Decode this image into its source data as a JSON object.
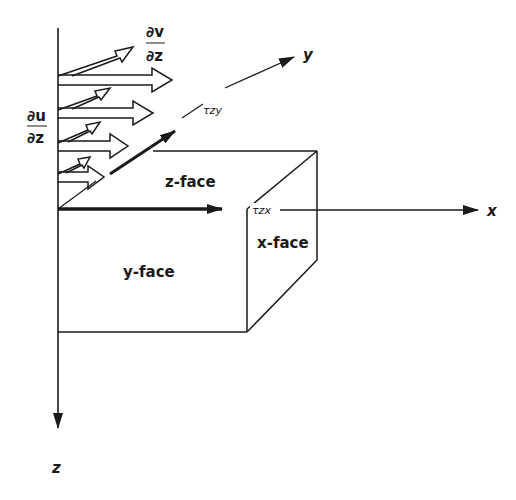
{
  "diagram": {
    "axes": {
      "x_label": "x",
      "y_label": "y",
      "z_label": "z"
    },
    "faces": {
      "z_face": "z-face",
      "y_face": "y-face",
      "x_face": "x-face"
    },
    "stresses": {
      "tau_zy": "τzy",
      "tau_zx": "τzx"
    },
    "gradients": {
      "dv_dz_num": "∂v",
      "dv_dz_den": "∂z",
      "du_dz_num": "∂u",
      "du_dz_den": "∂z"
    },
    "colors": {
      "ink": "#1a1a1a",
      "background": "#ffffff"
    }
  }
}
